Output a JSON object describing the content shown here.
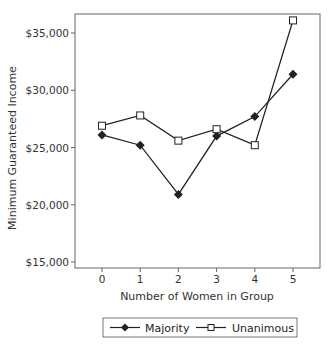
{
  "chart_data": {
    "type": "line",
    "title": "",
    "xlabel": "Number of Women in Group",
    "ylabel": "Minimum Guaranteed Income",
    "x": [
      0,
      1,
      2,
      3,
      4,
      5
    ],
    "categories": [
      "0",
      "1",
      "2",
      "3",
      "4",
      "5"
    ],
    "ylim": [
      15000,
      35000
    ],
    "yticks": [
      15000,
      20000,
      25000,
      30000,
      35000
    ],
    "ytick_labels": [
      "$15,000",
      "$20,000",
      "$25,000",
      "$30,000",
      "$35,000"
    ],
    "grid": false,
    "legend_position": "bottom",
    "series": [
      {
        "name": "Majority",
        "marker": "diamond-filled",
        "color": "#222222",
        "values": [
          26100,
          25200,
          20900,
          26000,
          27700,
          31400
        ]
      },
      {
        "name": "Unanimous",
        "marker": "square-open",
        "color": "#222222",
        "values": [
          26900,
          27800,
          25600,
          26600,
          25200,
          36100
        ]
      }
    ]
  },
  "legend": {
    "items": [
      {
        "label": "Majority",
        "icon": "diamond-filled-marker"
      },
      {
        "label": "Unanimous",
        "icon": "square-open-marker"
      }
    ]
  }
}
